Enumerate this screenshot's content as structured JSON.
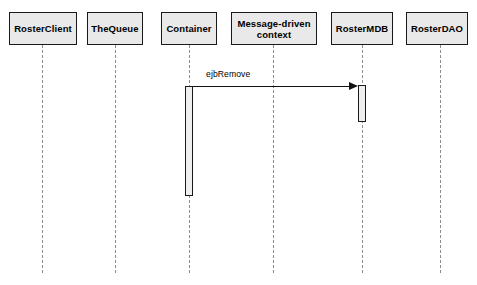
{
  "diagram": {
    "type": "uml-sequence-diagram",
    "background_color": "#ffffff",
    "box_fill_color": "#e9e9e9",
    "box_border_color": "#1a1a1a",
    "lifeline_color": "#8d8d8d",
    "message_color": "#111111",
    "participants": [
      {
        "name": "roster-client",
        "label": "RosterClient",
        "x": 9,
        "y": 12,
        "width": 68,
        "height": 33,
        "lifeline_x": 42
      },
      {
        "name": "the-queue",
        "label": "TheQueue",
        "x": 87,
        "y": 12,
        "width": 56,
        "height": 33,
        "lifeline_x": 115
      },
      {
        "name": "container",
        "label": "Container",
        "x": 161,
        "y": 12,
        "width": 56,
        "height": 33,
        "lifeline_x": 189
      },
      {
        "name": "message-driven-context",
        "label": "Message-driven\ncontext",
        "x": 231,
        "y": 12,
        "width": 86,
        "height": 33,
        "lifeline_x": 273
      },
      {
        "name": "roster-mdb",
        "label": "RosterMDB",
        "x": 331,
        "y": 12,
        "width": 62,
        "height": 33,
        "lifeline_x": 362
      },
      {
        "name": "roster-dao",
        "label": "RosterDAO",
        "x": 406,
        "y": 12,
        "width": 62,
        "height": 33,
        "lifeline_x": 440
      }
    ],
    "lifeline_top": 45,
    "lifeline_bottom": 273,
    "activations": [
      {
        "name": "container-activation",
        "owner": "Container",
        "x": 185,
        "y": 86,
        "width": 8,
        "height": 110
      },
      {
        "name": "roster-mdb-activation",
        "owner": "RosterMDB",
        "x": 358,
        "y": 85,
        "width": 8,
        "height": 37
      }
    ],
    "messages": [
      {
        "name": "ejb-remove-message",
        "label": "ejbRemove",
        "from": "Container",
        "to": "RosterMDB",
        "kind": "synchronous-call",
        "x_start": 193,
        "x_end": 358,
        "y": 86,
        "label_x": 206,
        "label_y": 69
      }
    ]
  }
}
